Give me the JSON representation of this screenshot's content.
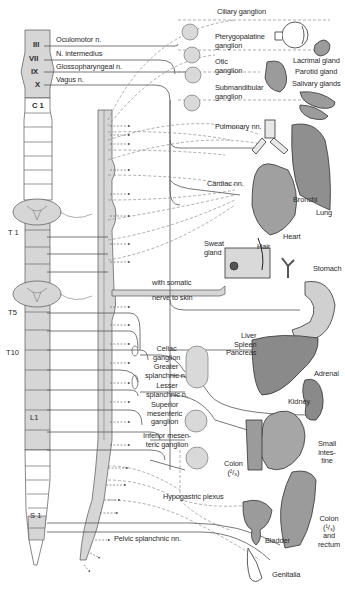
{
  "figure": {
    "type": "anatomical-diagram",
    "colors": {
      "cord_shading": "#d6d6d6",
      "organ_fill": "#9b9b9b",
      "organ_light": "#c4c4c4",
      "ganglion_fill": "#d9d9d9",
      "line": "#555555",
      "dashed_line": "#8a8a8a"
    }
  },
  "cranial_nerves": [
    {
      "numeral": "III",
      "label": "Oculomotor n."
    },
    {
      "numeral": "VII",
      "label": "N. intermedius"
    },
    {
      "numeral": "IX",
      "label": "Glossopharyngeal n."
    },
    {
      "numeral": "X",
      "label": "Vagus n."
    }
  ],
  "spinal_segments": {
    "c1": "C 1",
    "t1": "T 1",
    "t5": "T5",
    "t10": "T10",
    "l1": "L1",
    "s1": "S 1"
  },
  "head_ganglia": [
    {
      "label": "Ciliary ganglion"
    },
    {
      "label": "Pterygopalatine\nganglion"
    },
    {
      "label": "Otic\nganglion"
    },
    {
      "label": "Submandibular\nganglion"
    }
  ],
  "organs": {
    "lacrimal": "Lacrimal gland",
    "parotid": "Parotid gland",
    "salivary": "Salivary glands",
    "pulmonary": "Pulmonary nn.",
    "cardiac": "Cardiac nn.",
    "bronchi": "Bronchi",
    "lung": "Lung",
    "heart": "Heart",
    "sweat_gland": "Sweat\ngland",
    "hair": "Hair",
    "somatic1": "with somatic",
    "somatic2": "nerve to skin",
    "stomach": "Stomach",
    "liver_group": "Liver\nSpleen\nPancreas",
    "adrenal": "Adrenal",
    "kidney": "Kidney",
    "small_intestine": "Small\nintes-\ntine",
    "colon_upper": "Colon\n(²/₃)",
    "colon_lower": "Colon\n(¹/₃)\nand\nrectum",
    "bladder": "Bladder",
    "genitalia": "Genitalia"
  },
  "abdominal_ganglia": {
    "celiac": "Celiac\nganglion",
    "greater": "Greater\nsplanchnic n.",
    "lesser": "Lesser\nsplanchnic n.",
    "superior_mesenteric": "Superior\nmesenteric\nganglion",
    "inferior_mesenteric": "Inferior mesen-\nteric ganglion",
    "hypogastric": "Hypogastric plexus",
    "pelvic": "Pelvic splanchnic nn."
  }
}
